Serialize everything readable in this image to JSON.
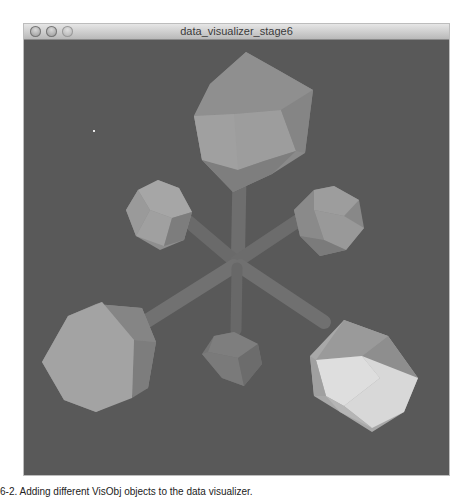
{
  "window": {
    "title": "data_visualizer_stage6",
    "controls": [
      {
        "name": "close-button",
        "icon": "close-icon"
      },
      {
        "name": "minimize-button",
        "icon": "minimize-icon"
      },
      {
        "name": "zoom-button",
        "icon": "zoom-icon"
      }
    ]
  },
  "scene": {
    "background": "#595959",
    "objects": [
      {
        "name": "icosahedron-top",
        "shape": "icosahedron",
        "position": "top-center"
      },
      {
        "name": "octahedron-upper-left",
        "shape": "icosahedron",
        "position": "upper-left"
      },
      {
        "name": "octahedron-upper-right",
        "shape": "icosahedron",
        "position": "upper-right"
      },
      {
        "name": "icosahedron-lower-left",
        "shape": "icosahedron",
        "position": "lower-left"
      },
      {
        "name": "icosahedron-lower-right",
        "shape": "icosahedron",
        "position": "lower-right"
      },
      {
        "name": "shape-bottom-center",
        "shape": "octahedron",
        "position": "bottom-center"
      }
    ],
    "connectors": 6
  },
  "caption": "6-2. Adding different VisObj objects to the data visualizer."
}
